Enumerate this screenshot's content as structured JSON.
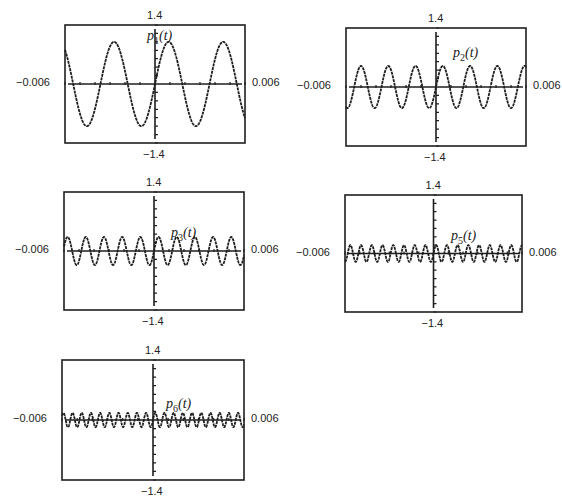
{
  "chart_data": [
    {
      "type": "line",
      "id": "p1",
      "label_fn": "p",
      "label_sub": "1",
      "label_arg": "(t)",
      "xlim": [
        -0.006,
        0.006
      ],
      "ylim": [
        -1.4,
        1.4
      ],
      "xtick_labels": {
        "left": "−0.006",
        "right": "0.006"
      },
      "ytick_labels": {
        "top": "1.4",
        "bottom": "−1.4"
      },
      "x_ticks_step": 0.001,
      "y_ticks_step": 0.2,
      "grid": false,
      "harmonic": 1,
      "amplitude": 1.0,
      "base_frequency_hz": 275,
      "formula": "sin(2*pi*275*t)"
    },
    {
      "type": "line",
      "id": "p2",
      "label_fn": "p",
      "label_sub": "2",
      "label_arg": "(t)",
      "xlim": [
        -0.006,
        0.006
      ],
      "ylim": [
        -1.4,
        1.4
      ],
      "xtick_labels": {
        "left": "−0.006",
        "right": "0.006"
      },
      "ytick_labels": {
        "top": "1.4",
        "bottom": "−1.4"
      },
      "x_ticks_step": 0.001,
      "y_ticks_step": 0.2,
      "grid": false,
      "harmonic": 2,
      "amplitude": 0.5,
      "base_frequency_hz": 275,
      "formula": "(1/2)sin(2*pi*550*t)"
    },
    {
      "type": "line",
      "id": "p3",
      "label_fn": "p",
      "label_sub": "3",
      "label_arg": "(t)",
      "xlim": [
        -0.006,
        0.006
      ],
      "ylim": [
        -1.4,
        1.4
      ],
      "xtick_labels": {
        "left": "−0.006",
        "right": "0.006"
      },
      "ytick_labels": {
        "top": "1.4",
        "bottom": "−1.4"
      },
      "x_ticks_step": 0.001,
      "y_ticks_step": 0.2,
      "grid": false,
      "harmonic": 3,
      "amplitude": 0.333,
      "base_frequency_hz": 275,
      "formula": "(1/3)sin(2*pi*825*t)"
    },
    {
      "type": "line",
      "id": "p5",
      "label_fn": "p",
      "label_sub": "5",
      "label_arg": "(t)",
      "xlim": [
        -0.006,
        0.006
      ],
      "ylim": [
        -1.4,
        1.4
      ],
      "xtick_labels": {
        "left": "−0.006",
        "right": "0.006"
      },
      "ytick_labels": {
        "top": "1.4",
        "bottom": "−1.4"
      },
      "x_ticks_step": 0.001,
      "y_ticks_step": 0.2,
      "grid": false,
      "harmonic": 5,
      "amplitude": 0.2,
      "base_frequency_hz": 275,
      "formula": "(1/5)sin(2*pi*1375*t)"
    },
    {
      "type": "line",
      "id": "p6",
      "label_fn": "p",
      "label_sub": "6",
      "label_arg": "(t)",
      "xlim": [
        -0.006,
        0.006
      ],
      "ylim": [
        -1.4,
        1.4
      ],
      "xtick_labels": {
        "left": "−0.006",
        "right": "0.006"
      },
      "ytick_labels": {
        "top": "1.4",
        "bottom": "−1.4"
      },
      "x_ticks_step": 0.001,
      "y_ticks_step": 0.2,
      "grid": false,
      "harmonic": 6,
      "amplitude": 0.167,
      "base_frequency_hz": 275,
      "formula": "(1/6)sin(2*pi*1650*t)"
    }
  ],
  "layout": {
    "panels": [
      {
        "id": "p1",
        "box": [
          65,
          25,
          180,
          118
        ],
        "label_pos": [
          147,
          28
        ]
      },
      {
        "id": "p2",
        "box": [
          346,
          28,
          180,
          118
        ],
        "label_pos": [
          453,
          45
        ]
      },
      {
        "id": "p3",
        "box": [
          64,
          192,
          180,
          118
        ],
        "label_pos": [
          171,
          225
        ]
      },
      {
        "id": "p5",
        "box": [
          345,
          195,
          177,
          117
        ],
        "label_pos": [
          451,
          228
        ]
      },
      {
        "id": "p6",
        "box": [
          62,
          360,
          182,
          120
        ],
        "label_pos": [
          166,
          396
        ]
      }
    ],
    "stroke_color": "#1e1e1e"
  }
}
